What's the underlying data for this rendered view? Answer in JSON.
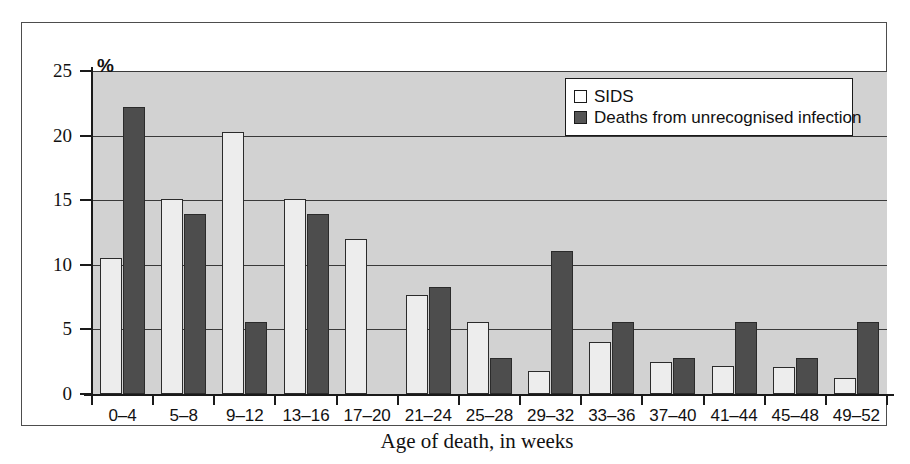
{
  "chart_data": {
    "type": "bar",
    "title": "",
    "xlabel": "Age of death, in weeks",
    "ylabel": "%",
    "categories": [
      "0–4",
      "5–8",
      "9–12",
      "13–16",
      "17–20",
      "21–24",
      "25–28",
      "29–32",
      "33–36",
      "37–40",
      "41–44",
      "45–48",
      "49–52"
    ],
    "series": [
      {
        "name": "SIDS",
        "color": "#ededed",
        "values": [
          10.5,
          15.1,
          20.3,
          15.1,
          12.0,
          7.7,
          5.6,
          1.8,
          4.0,
          2.5,
          2.2,
          2.1,
          1.2
        ]
      },
      {
        "name": "Deaths from unrecognised infection",
        "color": "#4d4d4d",
        "values": [
          22.2,
          13.9,
          5.6,
          13.9,
          0,
          8.3,
          2.8,
          11.1,
          5.6,
          2.8,
          5.6,
          2.8,
          5.6
        ]
      }
    ],
    "ylim": [
      0,
      25
    ],
    "yticks": [
      0,
      5,
      10,
      15,
      20,
      25
    ],
    "ytick_labels": [
      "0",
      "5",
      "10",
      "15",
      "20",
      "25"
    ],
    "grid": true,
    "legend_position": "top-right",
    "plot_background": "#d2d2d2"
  },
  "legend": {
    "items": [
      {
        "label": "SIDS"
      },
      {
        "label": "Deaths from unrecognised infection"
      }
    ]
  },
  "axis": {
    "y_unit_label": "%",
    "x_title": "Age of death, in weeks"
  }
}
